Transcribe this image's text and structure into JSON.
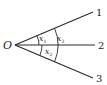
{
  "diagram": {
    "origin_label": "O",
    "rays": [
      {
        "id": "1",
        "label": "1"
      },
      {
        "id": "2",
        "label": "2"
      },
      {
        "id": "3",
        "label": "3"
      }
    ],
    "angles": [
      {
        "name": "x",
        "sub": "1",
        "between": [
          "1",
          "2"
        ]
      },
      {
        "name": "x",
        "sub": "2",
        "between": [
          "2",
          "3"
        ]
      },
      {
        "name": "x",
        "sub": "3",
        "between": [
          "1",
          "3"
        ]
      }
    ],
    "colors": {
      "stroke": "#2a2a2a",
      "background": "#ffffff"
    }
  }
}
